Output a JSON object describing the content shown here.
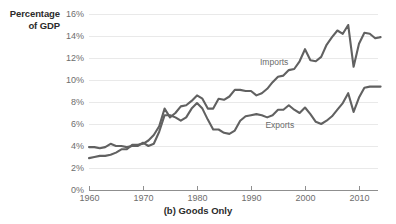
{
  "axis_title": {
    "line1": "Percentage",
    "line2": "of GDP"
  },
  "caption": "(b) Goods Only",
  "colors": {
    "line": "#616161",
    "grid": "#e9e9e9",
    "axis": "#8f8f8f",
    "tick_text": "#6d6d6d",
    "title_text": "#2b2b2b"
  },
  "series_labels": {
    "imports": "Imports",
    "exports": "Exports"
  },
  "yticks": [
    {
      "label": "0%",
      "value": 0
    },
    {
      "label": "2%",
      "value": 2
    },
    {
      "label": "4%",
      "value": 4
    },
    {
      "label": "6%",
      "value": 6
    },
    {
      "label": "8%",
      "value": 8
    },
    {
      "label": "10%",
      "value": 10
    },
    {
      "label": "12%",
      "value": 12
    },
    {
      "label": "14%",
      "value": 14
    },
    {
      "label": "16%",
      "value": 16
    }
  ],
  "xticks": [
    {
      "label": "1960",
      "value": 1960
    },
    {
      "label": "1970",
      "value": 1970
    },
    {
      "label": "1980",
      "value": 1980
    },
    {
      "label": "1990",
      "value": 1990
    },
    {
      "label": "2000",
      "value": 2000
    },
    {
      "label": "2010",
      "value": 2010
    }
  ],
  "chart_data": {
    "type": "line",
    "title": "(b) Goods Only",
    "xlabel": "",
    "ylabel": "Percentage of GDP",
    "ylim": [
      0,
      16.8
    ],
    "xlim": [
      1960,
      2014
    ],
    "grid": true,
    "legend": "inline-annotations",
    "x": [
      1960,
      1961,
      1962,
      1963,
      1964,
      1965,
      1966,
      1967,
      1968,
      1969,
      1970,
      1971,
      1972,
      1973,
      1974,
      1975,
      1976,
      1977,
      1978,
      1979,
      1980,
      1981,
      1982,
      1983,
      1984,
      1985,
      1986,
      1987,
      1988,
      1989,
      1990,
      1991,
      1992,
      1993,
      1994,
      1995,
      1996,
      1997,
      1998,
      1999,
      2000,
      2001,
      2002,
      2003,
      2004,
      2005,
      2006,
      2007,
      2008,
      2009,
      2010,
      2011,
      2012,
      2013,
      2014
    ],
    "series": [
      {
        "name": "Imports",
        "values": [
          2.9,
          3.0,
          3.1,
          3.1,
          3.2,
          3.4,
          3.7,
          3.7,
          4.1,
          4.1,
          4.2,
          4.5,
          5.0,
          5.8,
          7.4,
          6.6,
          7.0,
          7.6,
          7.7,
          8.1,
          8.6,
          8.3,
          7.4,
          7.4,
          8.3,
          8.2,
          8.5,
          9.1,
          9.1,
          9.0,
          9.0,
          8.6,
          8.8,
          9.2,
          9.8,
          10.3,
          10.4,
          10.9,
          11.0,
          11.7,
          12.8,
          11.8,
          11.7,
          12.1,
          13.2,
          13.9,
          14.5,
          14.2,
          15.0,
          11.2,
          13.3,
          14.3,
          14.2,
          13.8,
          13.9
        ]
      },
      {
        "name": "Exports",
        "values": [
          3.9,
          3.9,
          3.8,
          3.9,
          4.2,
          4.0,
          4.0,
          3.9,
          4.0,
          4.0,
          4.3,
          4.0,
          4.2,
          5.3,
          6.8,
          6.8,
          6.6,
          6.3,
          6.6,
          7.4,
          7.9,
          7.4,
          6.4,
          5.5,
          5.5,
          5.2,
          5.1,
          5.4,
          6.3,
          6.7,
          6.8,
          6.9,
          6.8,
          6.6,
          6.8,
          7.3,
          7.3,
          7.7,
          7.3,
          7.0,
          7.5,
          6.9,
          6.2,
          6.0,
          6.3,
          6.7,
          7.3,
          7.9,
          8.8,
          7.1,
          8.4,
          9.3,
          9.4,
          9.4,
          9.4
        ]
      }
    ],
    "annotations": [
      {
        "text": "Imports",
        "x": 1995,
        "y": 11.6
      },
      {
        "text": "Exports",
        "x": 1996,
        "y": 5.9
      }
    ]
  }
}
